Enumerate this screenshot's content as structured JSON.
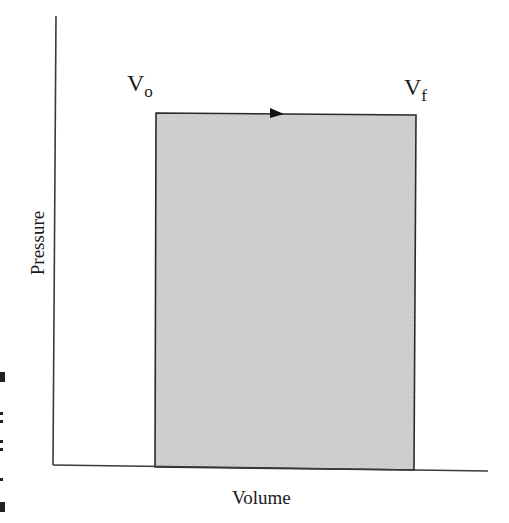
{
  "diagram": {
    "type": "pressure-volume isobaric process",
    "axes": {
      "xlabel": "Volume",
      "ylabel": "Pressure"
    },
    "states": [
      {
        "symbol": "V",
        "subscript": "o",
        "label": "V_o"
      },
      {
        "symbol": "V",
        "subscript": "f",
        "label": "V_f"
      }
    ],
    "process": {
      "direction": "left-to-right",
      "pressure": "constant",
      "shaded_area": "work done"
    },
    "colors": {
      "fill": "#cfcfcf",
      "line": "#2a2a2a",
      "background": "#ffffff"
    }
  }
}
